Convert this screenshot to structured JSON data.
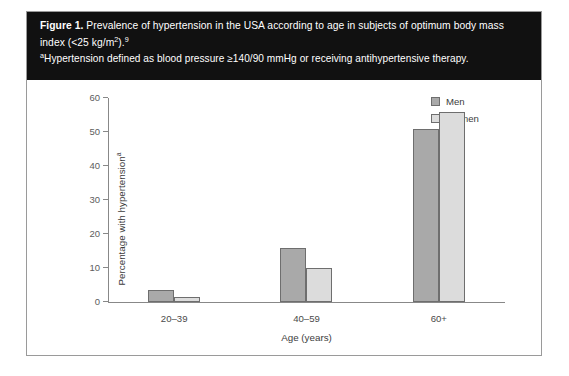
{
  "figure": {
    "label": "Figure 1.",
    "caption_line1": "Prevalence of hypertension in the USA according to age in subjects of optimum body mass",
    "caption_line2_pre": "index (<25 kg/m",
    "caption_line2_sup": "2",
    "caption_line2_post": ").",
    "caption_line2_ref": "9",
    "note_marker": "a",
    "note_text": "Hypertension defined as blood pressure ≥140/90 mmHg or receiving antihypertensive therapy."
  },
  "legend": {
    "position": "top-right",
    "items": [
      {
        "label": "Men",
        "color": "#a9a9a9",
        "swatch": "men"
      },
      {
        "label": "Women",
        "color": "#dcdcdc",
        "swatch": "women"
      }
    ]
  },
  "axes": {
    "y_title_text": "Percentage with hypertension",
    "y_title_marker": "a",
    "x_title": "Age (years)",
    "y_ticks": [
      "0",
      "10",
      "20",
      "30",
      "40",
      "50",
      "60"
    ]
  },
  "chart_data": {
    "type": "bar",
    "title": "Prevalence of hypertension in the USA according to age in subjects of optimum body mass index (<25 kg/m2)",
    "categories": [
      "20–39",
      "40–59",
      "60+"
    ],
    "series": [
      {
        "name": "Men",
        "color": "#a9a9a9",
        "values": [
          3.5,
          16,
          51
        ]
      },
      {
        "name": "Women",
        "color": "#dcdcdc",
        "values": [
          1.5,
          10,
          56
        ]
      }
    ],
    "xlabel": "Age (years)",
    "ylabel": "Percentage with hypertension",
    "ylim": [
      0,
      60
    ],
    "ytick_step": 10,
    "grid": false,
    "legend_position": "top-right"
  }
}
